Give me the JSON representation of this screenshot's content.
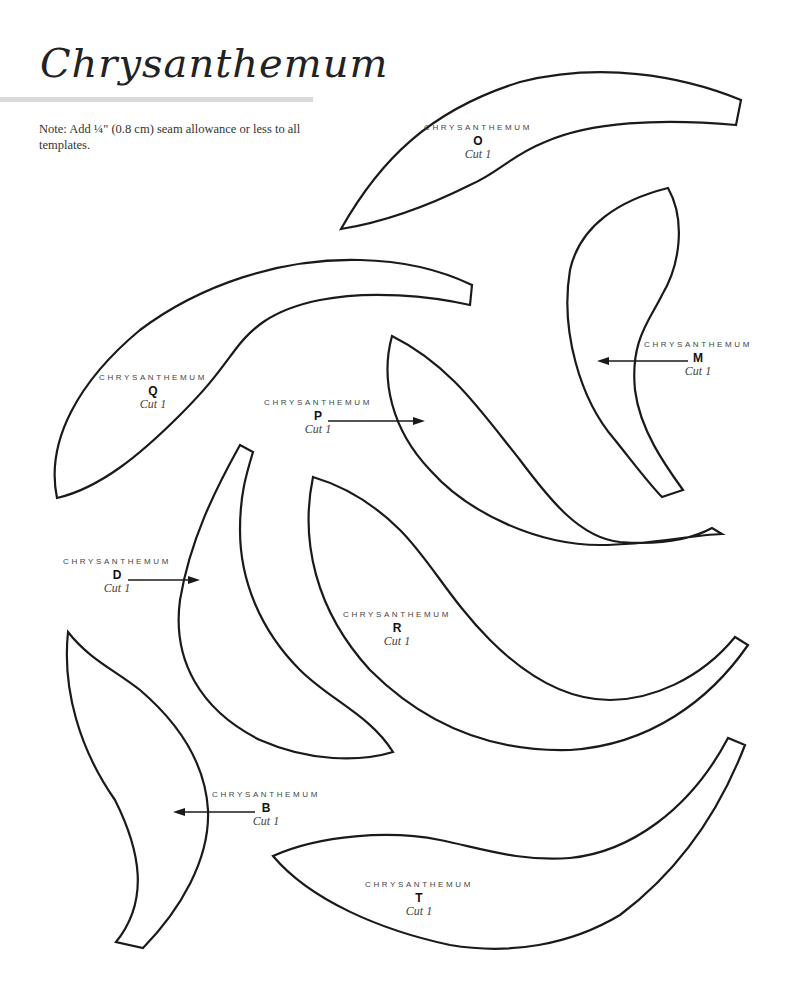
{
  "header": {
    "title": "Chrysanthemum",
    "note": "Note: Add ¼\" (0.8 cm) seam allowance or less to all templates."
  },
  "templates": [
    {
      "id": "O",
      "name": "CHRYSANTHEMUM",
      "letter": "O",
      "cut": "Cut 1",
      "arrow": "none"
    },
    {
      "id": "M",
      "name": "CHRYSANTHEMUM",
      "letter": "M",
      "cut": "Cut 1",
      "arrow": "left"
    },
    {
      "id": "Q",
      "name": "CHRYSANTHEMUM",
      "letter": "Q",
      "cut": "Cut 1",
      "arrow": "none"
    },
    {
      "id": "P",
      "name": "CHRYSANTHEMUM",
      "letter": "P",
      "cut": "Cut 1",
      "arrow": "right"
    },
    {
      "id": "D",
      "name": "CHRYSANTHEMUM",
      "letter": "D",
      "cut": "Cut 1",
      "arrow": "right"
    },
    {
      "id": "R",
      "name": "CHRYSANTHEMUM",
      "letter": "R",
      "cut": "Cut 1",
      "arrow": "none"
    },
    {
      "id": "B",
      "name": "CHRYSANTHEMUM",
      "letter": "B",
      "cut": "Cut 1",
      "arrow": "left"
    },
    {
      "id": "T",
      "name": "CHRYSANTHEMUM",
      "letter": "T",
      "cut": "Cut 1",
      "arrow": "none"
    }
  ],
  "colors": {
    "outline": "#1a1a1a",
    "rule": "#d9d9d9",
    "background": "#ffffff"
  }
}
